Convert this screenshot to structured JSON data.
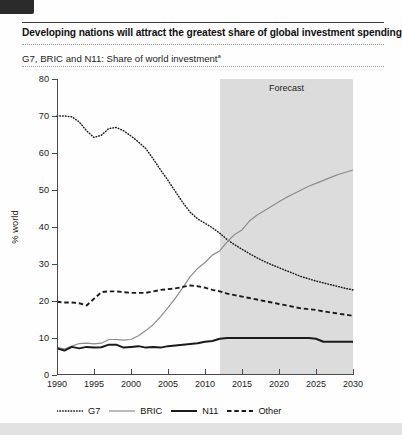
{
  "figure": {
    "title": "Developing nations will attract the greatest share of global investment spending",
    "subtitle": "G7, BRIC and N11: Share of world investment",
    "subtitle_footnote_marker": "a",
    "corner_mark": "corner-block"
  },
  "chart_data": {
    "type": "line",
    "title": "G7, BRIC and N11: Share of world investment",
    "xlabel": "",
    "ylabel": "% world",
    "xlim": [
      1990,
      2030
    ],
    "ylim": [
      0,
      80
    ],
    "ytick_values": [
      0,
      10,
      20,
      30,
      40,
      50,
      60,
      70,
      80
    ],
    "xtick_values": [
      1990,
      1995,
      2000,
      2005,
      2010,
      2015,
      2020,
      2025,
      2030
    ],
    "grid": false,
    "legend_position": "below",
    "annotations": [
      {
        "text": "Forecast",
        "x_start": 2012,
        "x_end": 2030,
        "type": "shaded-band"
      }
    ],
    "x": [
      1990,
      1991,
      1992,
      1993,
      1994,
      1995,
      1996,
      1997,
      1998,
      1999,
      2000,
      2001,
      2002,
      2003,
      2004,
      2005,
      2006,
      2007,
      2008,
      2009,
      2010,
      2011,
      2012,
      2013,
      2014,
      2015,
      2016,
      2017,
      2018,
      2019,
      2020,
      2021,
      2022,
      2023,
      2024,
      2025,
      2026,
      2027,
      2028,
      2029,
      2030
    ],
    "series": [
      {
        "name": "G7",
        "style": "dotted",
        "color": "#1a1a1a",
        "values": [
          70.0,
          70.0,
          69.8,
          68.4,
          66.0,
          64.2,
          64.8,
          66.6,
          66.9,
          66.0,
          64.6,
          63.0,
          61.2,
          58.4,
          55.4,
          52.6,
          49.6,
          46.6,
          44.0,
          42.2,
          41.0,
          39.8,
          38.3,
          36.6,
          35.2,
          34.0,
          32.8,
          31.7,
          30.7,
          29.8,
          29.0,
          28.2,
          27.4,
          26.6,
          26.0,
          25.4,
          24.9,
          24.4,
          23.9,
          23.4,
          23.0
        ]
      },
      {
        "name": "BRIC",
        "style": "solid-thin",
        "color": "#8c8c8c",
        "values": [
          7.5,
          7.0,
          7.8,
          8.5,
          8.6,
          8.4,
          8.6,
          9.6,
          9.6,
          9.4,
          9.6,
          10.6,
          12.0,
          13.6,
          15.8,
          18.2,
          20.8,
          23.6,
          26.6,
          28.8,
          30.4,
          32.4,
          33.6,
          36.0,
          38.0,
          39.2,
          41.6,
          43.2,
          44.4,
          45.6,
          46.8,
          48.0,
          49.0,
          50.0,
          51.0,
          51.8,
          52.6,
          53.4,
          54.2,
          54.8,
          55.4
        ]
      },
      {
        "name": "N11",
        "style": "solid-thick",
        "color": "#1a1a1a",
        "values": [
          7.2,
          6.6,
          7.6,
          7.2,
          7.6,
          7.4,
          7.5,
          8.2,
          8.2,
          7.4,
          7.6,
          7.8,
          7.4,
          7.6,
          7.4,
          7.8,
          8.0,
          8.2,
          8.4,
          8.6,
          9.0,
          9.2,
          9.8,
          10.0,
          10.0,
          10.0,
          10.0,
          10.0,
          10.0,
          10.0,
          10.0,
          10.0,
          10.0,
          10.0,
          10.0,
          9.8,
          9.0,
          9.0,
          9.0,
          9.0,
          9.0
        ]
      },
      {
        "name": "Other",
        "style": "dashed",
        "color": "#1a1a1a",
        "values": [
          19.8,
          19.6,
          19.6,
          19.4,
          18.8,
          20.6,
          22.4,
          22.6,
          22.6,
          22.4,
          22.2,
          22.2,
          22.2,
          22.6,
          23.0,
          23.2,
          23.4,
          23.8,
          24.2,
          24.0,
          23.6,
          23.0,
          22.6,
          22.0,
          21.6,
          21.2,
          20.8,
          20.4,
          20.0,
          19.6,
          19.2,
          18.8,
          18.4,
          18.0,
          17.8,
          17.6,
          17.2,
          16.9,
          16.6,
          16.3,
          16.0
        ]
      }
    ],
    "legend": [
      {
        "label": "G7",
        "style": "dotted"
      },
      {
        "label": "BRIC",
        "style": "solid-thin"
      },
      {
        "label": "N11",
        "style": "solid-thick"
      },
      {
        "label": "Other",
        "style": "dashed"
      }
    ]
  }
}
